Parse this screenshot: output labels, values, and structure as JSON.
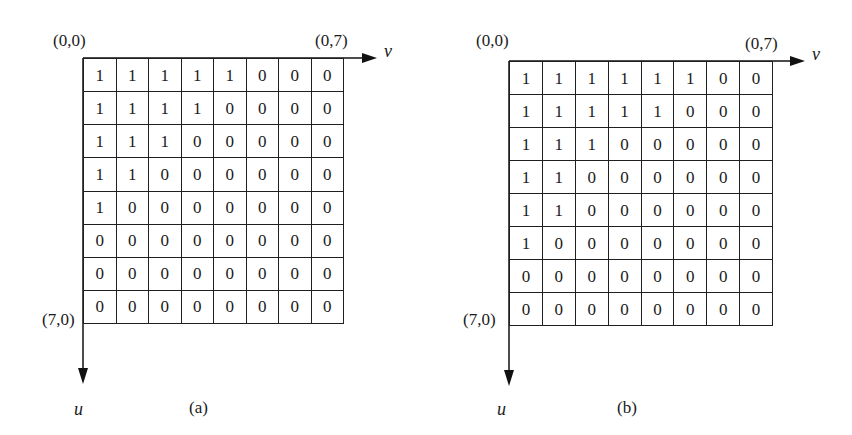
{
  "figure": {
    "panels": [
      {
        "caption": "(a)",
        "origin_label": "(0,0)",
        "top_right_label": "(0,7)",
        "bottom_left_label": "(7,0)",
        "horizontal_axis": "v",
        "vertical_axis": "u",
        "matrix": [
          [
            "1",
            "1",
            "1",
            "1",
            "1",
            "0",
            "0",
            "0"
          ],
          [
            "1",
            "1",
            "1",
            "1",
            "0",
            "0",
            "0",
            "0"
          ],
          [
            "1",
            "1",
            "1",
            "0",
            "0",
            "0",
            "0",
            "0"
          ],
          [
            "1",
            "1",
            "0",
            "0",
            "0",
            "0",
            "0",
            "0"
          ],
          [
            "1",
            "0",
            "0",
            "0",
            "0",
            "0",
            "0",
            "0"
          ],
          [
            "0",
            "0",
            "0",
            "0",
            "0",
            "0",
            "0",
            "0"
          ],
          [
            "0",
            "0",
            "0",
            "0",
            "0",
            "0",
            "0",
            "0"
          ],
          [
            "0",
            "0",
            "0",
            "0",
            "0",
            "0",
            "0",
            "0"
          ]
        ]
      },
      {
        "caption": "(b)",
        "origin_label": "(0,0)",
        "top_right_label": "(0,7)",
        "bottom_left_label": "(7,0)",
        "horizontal_axis": "v",
        "vertical_axis": "u",
        "matrix": [
          [
            "1",
            "1",
            "1",
            "1",
            "1",
            "1",
            "0",
            "0"
          ],
          [
            "1",
            "1",
            "1",
            "1",
            "1",
            "0",
            "0",
            "0"
          ],
          [
            "1",
            "1",
            "1",
            "0",
            "0",
            "0",
            "0",
            "0"
          ],
          [
            "1",
            "1",
            "0",
            "0",
            "0",
            "0",
            "0",
            "0"
          ],
          [
            "1",
            "1",
            "0",
            "0",
            "0",
            "0",
            "0",
            "0"
          ],
          [
            "1",
            "0",
            "0",
            "0",
            "0",
            "0",
            "0",
            "0"
          ],
          [
            "0",
            "0",
            "0",
            "0",
            "0",
            "0",
            "0",
            "0"
          ],
          [
            "0",
            "0",
            "0",
            "0",
            "0",
            "0",
            "0",
            "0"
          ]
        ]
      }
    ]
  }
}
